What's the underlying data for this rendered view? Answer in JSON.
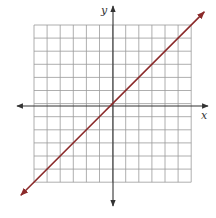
{
  "chart_data": {
    "type": "line",
    "title": "",
    "xlabel": "x",
    "ylabel": "y",
    "grid": true,
    "grid_cells": {
      "columns": 12,
      "rows": 12
    },
    "xlim": [
      -6,
      6
    ],
    "ylim": [
      -6,
      6
    ],
    "axes_arrows": true,
    "legend": null,
    "series": [
      {
        "name": "line",
        "equation": "y = x",
        "slope": 1,
        "intercept": 0,
        "arrows_both_ends": true,
        "x": [
          -7,
          7
        ],
        "y": [
          -7,
          7
        ],
        "color": "#8b2a2a"
      }
    ]
  },
  "labels": {
    "x_axis": "x",
    "y_axis": "y"
  },
  "colors": {
    "grid": "#9a9a9a",
    "axis": "#333333",
    "line": "#8b2a2a"
  }
}
